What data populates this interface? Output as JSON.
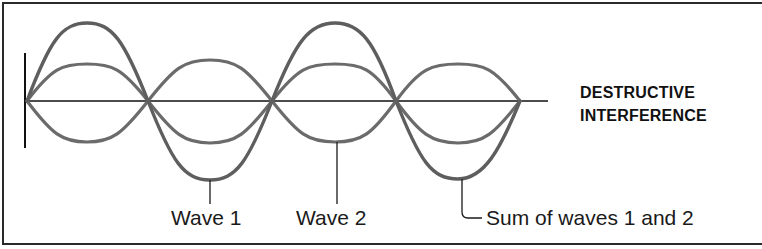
{
  "title": {
    "line1": "DESTRUCTIVE",
    "line2": "INTERFERENCE"
  },
  "labels": {
    "wave1": "Wave 1",
    "wave2": "Wave 2",
    "sum": "Sum of waves 1 and 2"
  },
  "colors": {
    "wave_stroke": "#6b6b6b",
    "axis": "#111111",
    "frame": "#2a2a2a",
    "text": "#1a1a1a"
  },
  "geometry": {
    "baseline_y": 101,
    "node_x": [
      27,
      148,
      272,
      396,
      520
    ],
    "wave1_amplitude_px": 40,
    "wave2_amplitude_px": 40,
    "sum_amplitude_px": 80
  }
}
